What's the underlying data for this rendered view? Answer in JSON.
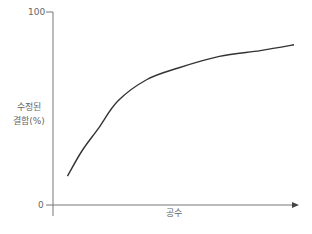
{
  "chart_data": {
    "type": "line",
    "title": "",
    "xlabel": "공수",
    "ylabel": "수정된 결함(%)",
    "ylabel_lines": [
      "수정된",
      "결함(%)"
    ],
    "yticks": [
      "100",
      "0"
    ],
    "ylim": [
      0,
      100
    ],
    "xticks": [],
    "grid": false,
    "legend": null,
    "series": [
      {
        "name": "수정된 결함",
        "x": [
          0.06,
          0.12,
          0.19,
          0.27,
          0.39,
          0.52,
          0.69,
          0.86,
          1.0
        ],
        "values": [
          15,
          28,
          40,
          54,
          65,
          71,
          77,
          80,
          83
        ]
      }
    ],
    "annotations": []
  },
  "axis": {
    "y_max_label": "100",
    "y_min_label": "0",
    "x_label": "공수",
    "y_label_line1": "수정된",
    "y_label_line2": "결함(%)"
  },
  "colors": {
    "curve": "#333333",
    "axis": "#666666",
    "text": "#666666"
  }
}
